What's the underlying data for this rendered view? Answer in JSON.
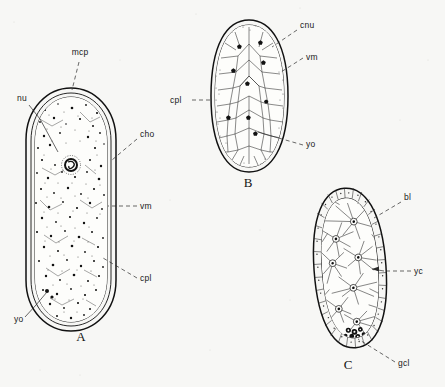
{
  "figure": {
    "type": "scientific-line-drawing",
    "background_color": "#f7f7f5",
    "ink_color": "#111111",
    "panels": [
      {
        "id": "A",
        "letter": "A",
        "letter_pos": {
          "x": 81,
          "y": 341
        },
        "shape": "elongate capsule with double-contour outer membrane and dense stippled cytoplasm containing one large nucleus",
        "bounds": {
          "x": 25,
          "y": 88,
          "width": 92,
          "height": 244
        },
        "labels": [
          {
            "text": "mcp",
            "x": 80,
            "y": 55,
            "anchor": "middle",
            "leader": "dashed",
            "target": {
              "x": 72,
              "y": 92
            }
          },
          {
            "text": "nu",
            "x": 22,
            "y": 101,
            "anchor": "middle",
            "leader": "solid",
            "target": {
              "x": 58,
              "y": 152
            }
          },
          {
            "text": "cho",
            "x": 140,
            "y": 137,
            "anchor": "start",
            "leader": "dashed",
            "target": {
              "x": 112,
              "y": 160
            }
          },
          {
            "text": "vm",
            "x": 140,
            "y": 209,
            "anchor": "start",
            "leader": "dashed",
            "target": {
              "x": 110,
              "y": 206
            }
          },
          {
            "text": "cpl",
            "x": 140,
            "y": 281,
            "anchor": "start",
            "leader": "dashed",
            "target": {
              "x": 103,
              "y": 258
            }
          },
          {
            "text": "yo",
            "x": 14,
            "y": 322,
            "anchor": "start",
            "leader": "solid",
            "target": {
              "x": 47,
              "y": 293
            }
          }
        ]
      },
      {
        "id": "B",
        "letter": "B",
        "letter_pos": {
          "x": 248,
          "y": 187
        },
        "shape": "oval outlined by stippled rim enclosing polygonal cell mosaic with scattered dark yolk granules",
        "bounds": {
          "x": 211,
          "y": 20,
          "width": 77,
          "height": 152
        },
        "labels": [
          {
            "text": "cnu",
            "x": 300,
            "y": 28,
            "anchor": "start",
            "leader": "dashed",
            "target": {
              "x": 272,
              "y": 47
            }
          },
          {
            "text": "vm",
            "x": 306,
            "y": 60,
            "anchor": "start",
            "leader": "dashed",
            "target": {
              "x": 281,
              "y": 72
            }
          },
          {
            "text": "cpl",
            "x": 170,
            "y": 103,
            "anchor": "start",
            "leader": "dashed",
            "target": {
              "x": 212,
              "y": 100
            }
          },
          {
            "text": "yo",
            "x": 306,
            "y": 147,
            "anchor": "start",
            "leader": "dashed",
            "target": {
              "x": 258,
              "y": 133
            }
          }
        ]
      },
      {
        "id": "C",
        "letter": "C",
        "letter_pos": {
          "x": 348,
          "y": 369
        },
        "shape": "oval with palisade border layer of small cells, radiating internal strands meeting at stellate nodes, dark germ-cell cluster at base",
        "bounds": {
          "x": 314,
          "y": 188,
          "width": 72,
          "height": 160
        },
        "labels": [
          {
            "text": "bl",
            "x": 404,
            "y": 200,
            "anchor": "start",
            "leader": "dashed",
            "target": {
              "x": 374,
              "y": 217
            }
          },
          {
            "text": "yc",
            "x": 414,
            "y": 273,
            "anchor": "start",
            "leader": "arrow",
            "target": {
              "x": 372,
              "y": 269
            }
          },
          {
            "text": "gcl",
            "x": 398,
            "y": 366,
            "anchor": "start",
            "leader": "dashed",
            "target": {
              "x": 355,
              "y": 340
            }
          }
        ]
      }
    ],
    "abbreviations": [
      "mcp",
      "nu",
      "cho",
      "vm",
      "cpl",
      "yo",
      "cnu",
      "bl",
      "yc",
      "gcl"
    ]
  }
}
